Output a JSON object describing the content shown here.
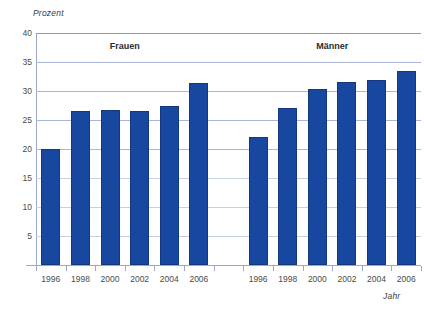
{
  "chart_data": {
    "type": "bar",
    "title": "",
    "xlabel": "Jahr",
    "ylabel": "Prozent",
    "ylim": [
      0,
      40
    ],
    "yticks": [
      40,
      35,
      30,
      25,
      20,
      15,
      10,
      5
    ],
    "grid": true,
    "legend_position": "none",
    "categories": [
      "1996",
      "1998",
      "2000",
      "2002",
      "2004",
      "2006"
    ],
    "groups": [
      {
        "name": "Frauen",
        "categories": [
          "1996",
          "1998",
          "2000",
          "2002",
          "2004",
          "2006"
        ],
        "values": [
          20.0,
          26.5,
          26.7,
          26.5,
          27.4,
          31.3
        ]
      },
      {
        "name": "Männer",
        "categories": [
          "1996",
          "1998",
          "2000",
          "2002",
          "2004",
          "2006"
        ],
        "values": [
          22.1,
          27.1,
          30.3,
          31.6,
          31.9,
          33.5
        ]
      }
    ],
    "series": [
      {
        "name": "Frauen",
        "values": [
          20.0,
          26.5,
          26.7,
          26.5,
          27.4,
          31.3
        ]
      },
      {
        "name": "Männer",
        "values": [
          22.1,
          27.1,
          30.3,
          31.6,
          31.9,
          33.5
        ]
      }
    ],
    "colors": {
      "bar": "#17479e",
      "grid": "#a9b6d4",
      "axis": "#9aa8c9",
      "text": "#4a4a4a"
    }
  }
}
